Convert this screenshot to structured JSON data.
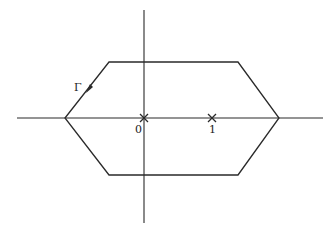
{
  "diagram": {
    "type": "contour-plot",
    "colors": {
      "line": "#2a2a2a",
      "background": "#ffffff"
    },
    "axes": {
      "horizontal": {
        "x1": 17,
        "x2": 323,
        "y": 118
      },
      "vertical": {
        "x": 144,
        "y1": 10,
        "y2": 223
      }
    },
    "contour": {
      "label": "Γ",
      "vertices": [
        [
          65,
          118
        ],
        [
          109,
          62
        ],
        [
          238,
          62
        ],
        [
          279,
          118
        ],
        [
          238,
          175
        ],
        [
          109,
          175
        ]
      ],
      "orientation": "counterclockwise",
      "arrow": {
        "x": 88,
        "y": 90
      }
    },
    "points": [
      {
        "label": "0",
        "x": 144,
        "y": 118,
        "marker": "×"
      },
      {
        "label": "1",
        "x": 212,
        "y": 118,
        "marker": "×"
      }
    ],
    "labels": {
      "gamma": "Γ",
      "zero": "0",
      "one": "1"
    }
  }
}
